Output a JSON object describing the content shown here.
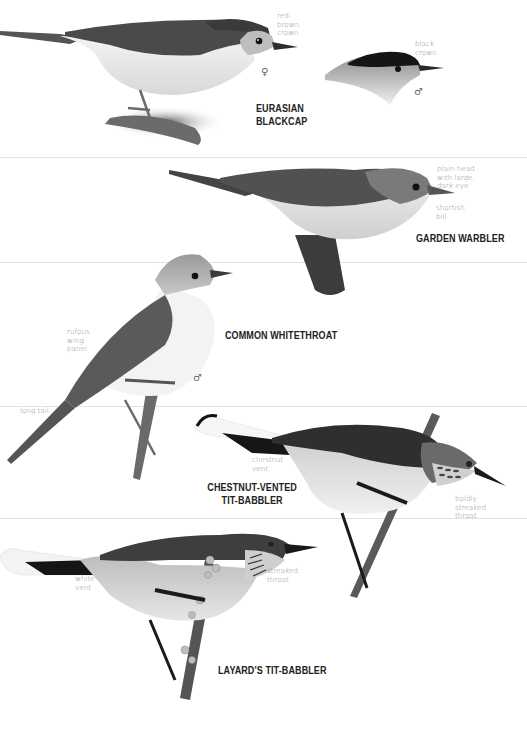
{
  "page": {
    "background": "#ffffff",
    "divider_color": "#e2e2e2",
    "text_color_heading": "#222222",
    "text_color_note": "#8a8a8a"
  },
  "species": [
    {
      "name_line1": "EURASIAN",
      "name_line2": "BLACKCAP",
      "figures": [
        {
          "sex": "♀",
          "sex_label": "female",
          "annotations": [
            "red-\nbrown\ncrown"
          ]
        },
        {
          "sex": "♂",
          "sex_label": "male",
          "annotations": [
            "black\ncrown"
          ]
        }
      ]
    },
    {
      "name": "GARDEN WARBLER",
      "annotations": [
        "plain head\nwith large,\ndark eye",
        "shortish\nbill"
      ]
    },
    {
      "name": "COMMON WHITETHROAT",
      "sex": "♂",
      "annotations": [
        "rufous\nwing\npanel",
        "long tail"
      ]
    },
    {
      "name_line1": "CHESTNUT-VENTED",
      "name_line2": "TIT-BABBLER",
      "annotations": [
        "chestnut\nvent",
        "boldly\nstreaked\nthroat"
      ]
    },
    {
      "name": "LAYARD'S TIT-BABBLER",
      "annotations": [
        "white\nvent",
        "streaked\nthroat"
      ]
    }
  ]
}
